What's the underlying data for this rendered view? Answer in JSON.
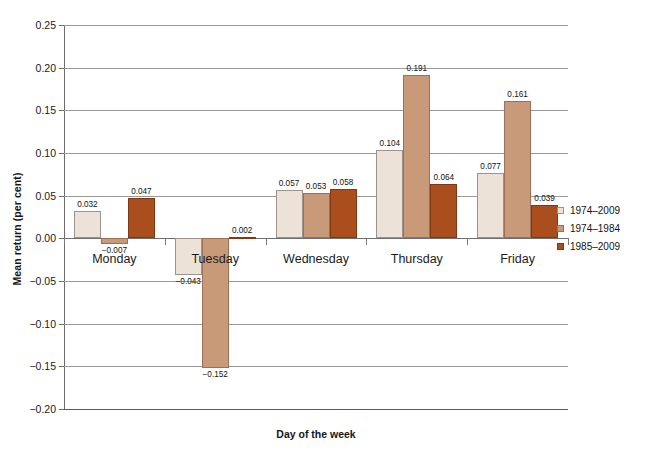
{
  "chart_data": {
    "type": "bar",
    "title": "",
    "xlabel": "Day of the week",
    "ylabel": "Mean return (per cent)",
    "categories": [
      "Monday",
      "Tuesday",
      "Wednesday",
      "Thursday",
      "Friday"
    ],
    "series": [
      {
        "name": "1974–2009",
        "color": "#ece2d8",
        "values": [
          0.032,
          -0.043,
          0.057,
          0.104,
          0.077
        ],
        "labels": [
          "0.032",
          "−0.043",
          "0.057",
          "0.104",
          "0.077"
        ]
      },
      {
        "name": "1974–1984",
        "color": "#c99a7a",
        "values": [
          -0.007,
          -0.152,
          0.053,
          0.191,
          0.161
        ],
        "labels": [
          "−0.007",
          "−0.152",
          "0.053",
          "0.191",
          "0.161"
        ]
      },
      {
        "name": "1985–2009",
        "color": "#a94e1c",
        "values": [
          0.047,
          0.002,
          0.058,
          0.064,
          0.039
        ],
        "labels": [
          "0.047",
          "0.002",
          "0.058",
          "0.064",
          "0.039"
        ]
      }
    ],
    "ylim": [
      -0.2,
      0.25
    ],
    "yticks": [
      0.25,
      0.2,
      0.15,
      0.1,
      0.05,
      0.0,
      -0.05,
      -0.1,
      -0.15,
      -0.2
    ],
    "ytick_labels": [
      "0.25",
      "0.20",
      "0.15",
      "0.10",
      "0.05",
      "0.00",
      "−0.05",
      "−0.10",
      "−0.15",
      "−0.20"
    ],
    "grid": true,
    "legend_position": "right"
  },
  "legend": {
    "items": [
      {
        "label": "1974–2009"
      },
      {
        "label": "1974–1984"
      },
      {
        "label": "1985–2009"
      }
    ]
  },
  "axes": {
    "y_title": "Mean return (per cent)",
    "x_title": "Day of the week"
  }
}
